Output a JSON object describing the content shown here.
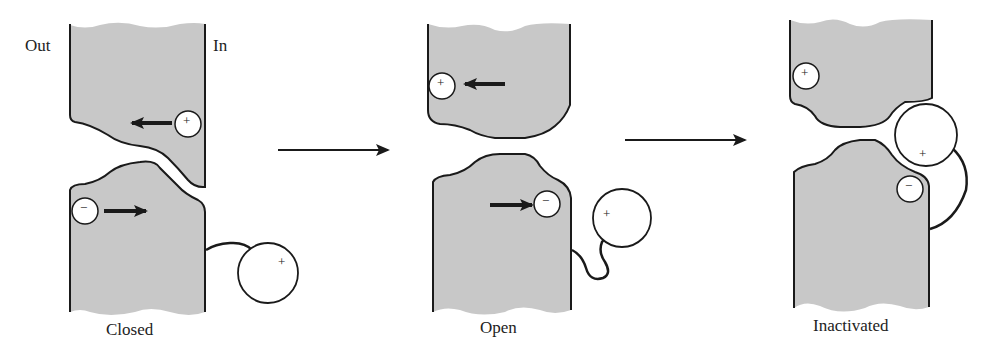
{
  "diagram": {
    "side_labels": {
      "outside": "Out",
      "inside": "In"
    },
    "states": [
      {
        "label": "Closed"
      },
      {
        "label": "Open"
      },
      {
        "label": "Inactivated"
      }
    ],
    "symbols": {
      "positive": "+",
      "negative": "−"
    },
    "colors": {
      "membrane_fill": "#c8c8c8",
      "stroke": "#1a1a1a",
      "background": "#ffffff"
    }
  }
}
